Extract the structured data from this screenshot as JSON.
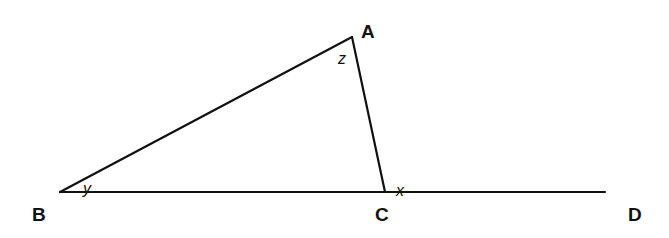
{
  "diagram": {
    "type": "geometry-triangle-exterior-angle",
    "points": {
      "A": {
        "label": "A",
        "x": 352,
        "y": 37,
        "label_x": 361,
        "label_y": 38
      },
      "B": {
        "label": "B",
        "x": 60,
        "y": 192,
        "label_x": 32,
        "label_y": 221
      },
      "C": {
        "label": "C",
        "x": 385,
        "y": 192,
        "label_x": 375,
        "label_y": 221
      },
      "D": {
        "label": "D",
        "x": 605,
        "y": 192,
        "label_x": 628,
        "label_y": 221
      }
    },
    "segments": [
      {
        "from": "B",
        "to": "A"
      },
      {
        "from": "A",
        "to": "C"
      },
      {
        "from": "B",
        "to": "D"
      }
    ],
    "angles": {
      "z": {
        "label": "z",
        "at": "A",
        "x": 338,
        "y": 64
      },
      "y": {
        "label": "y",
        "at": "B",
        "x": 83,
        "y": 194
      },
      "x": {
        "label": "x",
        "at": "C",
        "exterior": true,
        "x": 396,
        "y": 196
      }
    },
    "stroke_color": "#111111",
    "background": "#ffffff"
  }
}
